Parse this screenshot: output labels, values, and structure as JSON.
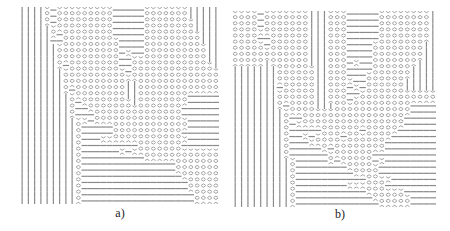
{
  "figure": {
    "panels": [
      {
        "id": "a",
        "label": "a)",
        "x": 19,
        "y": 7,
        "width": 200,
        "height": 197,
        "cols": 32,
        "rows": 32,
        "legend": {
          "|": "vertical",
          "x": "cross",
          "-": "horizontal"
        },
        "grid": [
          "||||x-xxxxxxxxx-----xxxxxxx|||||",
          "||||x-xxxxxxxxx-----xxxxxxx|||||",
          "||||x-xxxxxxxxx-----xxxxxxxx||||",
          "|||||xxxxxxxxxx-----xxxxxxxx||||",
          "|||||x-xxxxxxxx-----xxxxxxxxx|||",
          "|||||--xxxxxxxxx----xxxxxxxxx|||",
          "||||||xxxxxxxxxx----xxxxxxxxxx||",
          "||||||xxxxxxxxxx-x--xxxxxxxxxx||",
          "||||||xxxxxxxxxx--xxxxxxxxxxxx||",
          "||||||x-xxxxxxxx--xxxxxxxxxxxxx|",
          "|||||||xxxxxxxxxx-xxxxxxxxxxxxxx",
          "|||||||xxxxxxxxxxxxxxxxxxxxxxxxx",
          "|||||||xxxxxxxxxx||xxxxxxxxxxxxx",
          "|||||||x-xxxxxxxx||xxxxxxxxxxxxx",
          "||||||||xxxxxxxxx||xxxxxxxx-----",
          "||||||||x-xxxxxxxx|xxxxxxxx-----",
          "||||||||x--xxxxxxxxxxxxxxx------",
          "||||||||x---xxxxxxxxxxxxxx------",
          "|||||||||xx-xxxxxxxxxxxxxxx-----",
          "|||||||||x-----xxxxxxxxxxxx-----",
          "|||||||||x-----xxxxxxxxxxx------",
          "|||||||||x---xxxxxxxxxxxxxx-----",
          "|||||||||x---------xxxxxxx------",
          "|||||||||x------x-xxxxxxxxxxxxxx",
          "|||||||||x----------xxxxxxxxxxxx",
          "|||||||||x---------------xxxxxxx",
          "|||||||||x---------------xxxxxxx",
          "|||||||||x----------------xxxxxx",
          "|||||||||x-----------------xxxxx",
          "|||||||||x-----------------xxxxx",
          "|||||||||x------------------xxxx",
          "|||||||||x------------------xxxx"
        ]
      },
      {
        "id": "b",
        "label": "b)",
        "x": 232,
        "y": 11,
        "width": 204,
        "height": 196,
        "cols": 32,
        "rows": 32,
        "legend": {
          "|": "vertical",
          "x": "cross",
          "-": "horizontal"
        },
        "grid": [
          "xxxx-xxxxxxx|||xxx-----xxxxxxxx|",
          "xxxx-xxxxxxx|||xxx-----xxxxxxxx|",
          "xxxx-xxxxxxx|||xxx-----xxxxxxxx|",
          "xxxxxxxxxxxx|||xxx-----xxxxxxxx|",
          "xxxx--xxxxxx|||xxx-----xxxxxxxx|",
          "xxxxx-xxxxxx|||xxx----xxxxxxxx||",
          "xxxxxxxxxxxx|||xxx----xxxxxxxx||",
          "xxxxxxxxxxxx|||xxx----xxxxxxxx||",
          "xxxxx|xxxxxx|||xxx-x--xxxxxxx|||",
          "|||||||xxxxxx||xxx----xxxxxx||||",
          "|||||||xxxxxx||xxx---xxxxxxx||||",
          "|||||||xxxxxx||xxxx--xxxxxx|||||",
          "|||||||-xxxxx||xxx-x-xxxxxx|||||",
          "|||||||xxxxxx||xxx--xxxxxxxxxxxx",
          "|||||||xxxxxx||xxx-xxxxxxxxxxxxx",
          "|||||||x-xxxx|||xxxxxxxxxxxx----",
          "||||||||xxxxxxxxxxxxxxxxxxxx----",
          "||||||||x--xxxxxxxxxxxxxxxx-----",
          "||||||||x-xxxxxxxxxxxxxxxxx-----",
          "||||||||x-----xxxxxx-xxxxx------",
          "||||||||x--x-xxxx-xxxxxxx-------",
          "||||||||x---xxxxxxxxxxxx--------",
          "||||||||x-----x-xxxxxxxx--------",
          "||||||||x------xxxxxxx----------",
          "|||||||||x-----x-xxxxx-x--------",
          "|||||||||x--------xxxxx---------",
          "|||||||||x---------xxxx---------",
          "|||||||||x-----------xxxx-------",
          "|||||||||x--------xxxxxx--------",
          "|||||||||x-----------xxxxxx-----",
          "|||||||||x------------xxxxxx----",
          "|||||||||x-------------xxxxx----"
        ]
      }
    ]
  },
  "captions": {
    "a": "a)",
    "b": "b)"
  },
  "colors": {
    "ink": "#8a8a8a",
    "background": "#ffffff"
  }
}
